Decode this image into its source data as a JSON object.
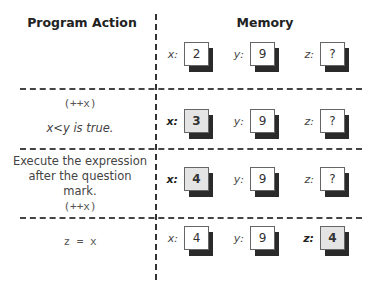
{
  "headers": {
    "action": "Program Action",
    "memory": "Memory"
  },
  "rows": [
    {
      "action_lines": [],
      "memory": [
        {
          "label": "x:",
          "value": "2",
          "highlight": false
        },
        {
          "label": "y:",
          "value": "9",
          "highlight": false
        },
        {
          "label": "z:",
          "value": "?",
          "highlight": false
        }
      ]
    },
    {
      "action_lines": [
        "(++x)",
        "x<y is true."
      ],
      "memory": [
        {
          "label": "x:",
          "value": "3",
          "highlight": true
        },
        {
          "label": "y:",
          "value": "9",
          "highlight": false
        },
        {
          "label": "z:",
          "value": "?",
          "highlight": false
        }
      ]
    },
    {
      "action_lines": [
        "Execute the expression",
        "after the question mark.",
        "(++x)"
      ],
      "memory": [
        {
          "label": "x:",
          "value": "4",
          "highlight": true
        },
        {
          "label": "y:",
          "value": "9",
          "highlight": false
        },
        {
          "label": "z:",
          "value": "?",
          "highlight": false
        }
      ]
    },
    {
      "action_lines": [
        "z = x"
      ],
      "memory": [
        {
          "label": "x:",
          "value": "4",
          "highlight": false
        },
        {
          "label": "y:",
          "value": "9",
          "highlight": false
        },
        {
          "label": "z:",
          "value": "4",
          "highlight": true
        }
      ]
    }
  ]
}
